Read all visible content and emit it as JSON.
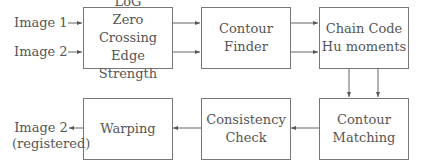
{
  "inputs": {
    "image1": "Image 1",
    "image2": "Image 2"
  },
  "output": {
    "line1": "Image 2",
    "line2": "(registered)"
  },
  "boxes": {
    "log": {
      "lines": [
        "LoG",
        "Zero Crossing",
        "Edge Strength"
      ]
    },
    "contour_finder": {
      "lines": [
        "Contour",
        "Finder"
      ]
    },
    "chain_code": {
      "lines": [
        "Chain Code",
        "Hu moments"
      ]
    },
    "contour_matching": {
      "lines": [
        "Contour",
        "Matching"
      ]
    },
    "consistency_check": {
      "lines": [
        "Consistency",
        "Check"
      ]
    },
    "warping": {
      "lines": [
        "Warping"
      ]
    }
  },
  "colors": {
    "stroke": "#777777",
    "text": "#555555"
  }
}
